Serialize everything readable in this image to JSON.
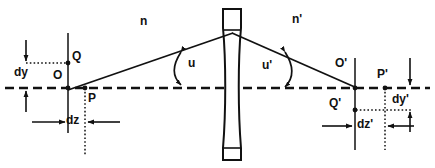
{
  "figure": {
    "kind": "optical-ray-diagram",
    "title": "",
    "stroke_color": "#111111",
    "background_color": "#ffffff",
    "width": 435,
    "height": 168
  },
  "axis": {
    "name": "optical-axis",
    "style": "dashed",
    "y": 88,
    "x_start": 5,
    "x_end": 430
  },
  "lens": {
    "name": "thin-biconvex-lens",
    "center_x": 232,
    "top_y": 8,
    "bottom_y": 160,
    "half_thickness": 9,
    "vertex_y": 33
  },
  "media": {
    "left_label": "n",
    "left_label_x": 140,
    "left_label_y": 22,
    "right_label": "n'",
    "right_label_x": 292,
    "right_label_y": 20
  },
  "angles": [
    {
      "name": "u",
      "label": "u",
      "label_x": 188,
      "label_y": 62,
      "side": "object"
    },
    {
      "name": "u'",
      "label": "u'",
      "label_x": 262,
      "label_y": 64,
      "side": "image"
    }
  ],
  "points": {
    "O": {
      "label": "O",
      "x": 68,
      "y": 88,
      "label_x": 55,
      "label_y": 74,
      "on_axis": true
    },
    "Q": {
      "label": "Q",
      "x": 68,
      "y": 63,
      "label_x": 71,
      "label_y": 54,
      "on_axis": false
    },
    "P": {
      "label": "P",
      "x": 85,
      "y": 88,
      "label_x": 88,
      "label_y": 91,
      "on_axis": true
    },
    "Op": {
      "label": "O'",
      "x": 355,
      "y": 88,
      "label_x": 336,
      "label_y": 62,
      "on_axis": true
    },
    "Qp": {
      "label": "Q'",
      "x": 355,
      "y": 110,
      "label_x": 330,
      "label_y": 101,
      "on_axis": false
    },
    "Pp": {
      "label": "P'",
      "x": 385,
      "y": 88,
      "label_x": 378,
      "label_y": 72,
      "on_axis": true
    }
  },
  "dimensions": [
    {
      "name": "dy",
      "label": "dy",
      "label_x": 16,
      "label_y": 66,
      "orientation": "vertical",
      "measures": "transverse object shift"
    },
    {
      "name": "dz",
      "label": "dz",
      "label_x": 62,
      "label_y": 124,
      "orientation": "horizontal",
      "measures": "longitudinal object shift"
    },
    {
      "name": "dy'",
      "label": "dy'",
      "label_x": 396,
      "label_y": 96,
      "orientation": "vertical",
      "measures": "transverse image shift"
    },
    {
      "name": "dz'",
      "label": "dz'",
      "label_x": 358,
      "label_y": 126,
      "orientation": "horizontal",
      "measures": "longitudinal image shift"
    }
  ],
  "rays": [
    {
      "name": "object-ray",
      "from": "O",
      "to": "lens-vertex",
      "x1": 68,
      "y1": 90,
      "x2": 232,
      "y2": 33
    },
    {
      "name": "image-ray",
      "from": "lens-vertex",
      "to": "O'",
      "x1": 232,
      "y1": 33,
      "x2": 356,
      "y2": 88
    }
  ],
  "reference_lines": {
    "left_vertical_x": 68,
    "left_vertical_top": 33,
    "left_vertical_bottom": 133,
    "right_vertical_x": 355,
    "right_vertical_top": 58,
    "right_vertical_bottom": 150,
    "left_dotted_vertical_x": 85,
    "right_dotted_vertical_x": 385
  }
}
